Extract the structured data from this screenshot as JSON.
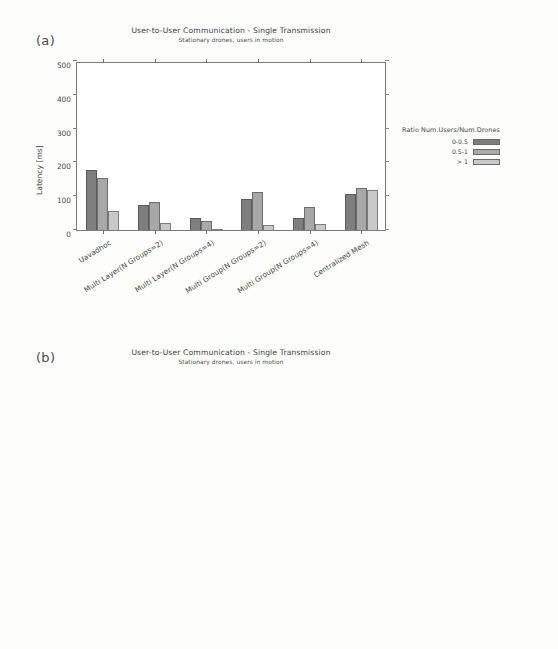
{
  "figure": {
    "panels": [
      {
        "letter": "(a)",
        "title": "User-to-User Communication - Single Transmission",
        "subtitle": "Stationary drones, users in motion"
      },
      {
        "letter": "(b)",
        "title": "User-to-User Communication - Single Transmission",
        "subtitle": "Stationary drones, users in motion"
      }
    ],
    "legend": {
      "title": "Ratio Num.Users/Num.Drones",
      "entries": [
        {
          "label": "0-0.5",
          "color": "#7e7e7e"
        },
        {
          "label": "0.5-1",
          "color": "#a8a8a8"
        },
        {
          "label": "> 1",
          "color": "#c9c9c9"
        }
      ]
    }
  },
  "chart_data": [
    {
      "type": "bar",
      "panel": "(a)",
      "title": "User-to-User Communication - Single Transmission",
      "subtitle": "Stationary drones, users in motion",
      "xlabel": "",
      "ylabel": "Latency [ms]",
      "ylim": [
        0,
        500
      ],
      "yticks": [
        0,
        100,
        200,
        300,
        400,
        500
      ],
      "grid": false,
      "legend_position": "right",
      "legend_title": "Ratio Num.Users/Num.Drones",
      "categories": [
        "Uavadhoc",
        "Multi Layer(N Groups=2)",
        "Multi Layer(N Groups=4)",
        "Multi Group(N Groups=2)",
        "Multi Group(N Groups=4)",
        "Centralized Mesh"
      ],
      "series": [
        {
          "name": "0-0.5",
          "values": [
            179,
            75,
            36,
            92,
            35,
            108
          ]
        },
        {
          "name": "0.5-1",
          "values": [
            155,
            82,
            27,
            113,
            67,
            125
          ]
        },
        {
          "name": "> 1",
          "values": [
            55,
            22,
            3,
            14,
            18,
            118
          ]
        }
      ]
    },
    {
      "type": "bar",
      "panel": "(b)",
      "title": "User-to-User Communication - Single Transmission",
      "subtitle": "Stationary drones, users in motion",
      "xlabel": "",
      "ylabel": "Packet Delivery Ratio [%]",
      "ylim": [
        0,
        100
      ],
      "yticks": [
        0,
        20,
        40,
        60,
        80,
        100
      ],
      "grid": false,
      "legend_position": "right",
      "legend_title": "Ratio Num.Users/Num.Drones",
      "categories": [
        "Uavadhoc",
        "Multi Layer(N Groups=2)",
        "Multi Layer(N Groups=4)",
        "Multi Group(N Groups=2)",
        "Multi Group(N Groups=4)",
        "Centralized Mesh"
      ],
      "series": [
        {
          "name": "0-0.5",
          "values": [
            57,
            56,
            59,
            55,
            74,
            66
          ]
        },
        {
          "name": "0.5-1",
          "values": [
            53,
            46,
            57,
            53,
            66,
            68
          ]
        },
        {
          "name": "> 1",
          "values": [
            26,
            20,
            28,
            39,
            52,
            58
          ]
        }
      ]
    }
  ]
}
